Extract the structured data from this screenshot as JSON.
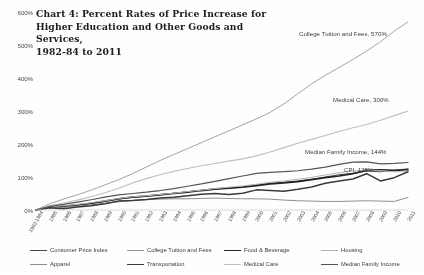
{
  "chart_data": {
    "type": "line",
    "title": "Chart 4: Percent Rates of Price Increase for\nHigher Education and Other Goods and Services,\n1982-84 to 2011",
    "xlabel": "",
    "ylabel": "",
    "ylim": [
      0,
      600
    ],
    "yticks": [
      0,
      100,
      200,
      300,
      400,
      500,
      600
    ],
    "ytick_labels": [
      "0%",
      "100%",
      "200%",
      "300%",
      "400%",
      "500%",
      "600%"
    ],
    "grid": false,
    "legend_position": "bottom",
    "x": [
      "1982-1984",
      "1985",
      "1986",
      "1987",
      "1988",
      "1989",
      "1990",
      "1991",
      "1992",
      "1993",
      "1994",
      "1995",
      "1996",
      "1997",
      "1998",
      "1999",
      "2000",
      "2001",
      "2002",
      "2003",
      "2004",
      "2005",
      "2006",
      "2007",
      "2008",
      "2009",
      "2010",
      "2011"
    ],
    "series": [
      {
        "name": "Consumer Price Index",
        "color": "#4a4a4a",
        "width": 1.0,
        "final_value": 125,
        "values": [
          0,
          9,
          11,
          15,
          20,
          26,
          33,
          38,
          42,
          47,
          51,
          55,
          60,
          64,
          66,
          70,
          76,
          81,
          84,
          88,
          93,
          100,
          107,
          111,
          118,
          116,
          120,
          125
        ]
      },
      {
        "name": "College Tuition and Fees",
        "color": "#9a9a9a",
        "width": 0.9,
        "final_value": 570,
        "values": [
          0,
          19,
          33,
          46,
          60,
          76,
          92,
          110,
          130,
          150,
          168,
          186,
          204,
          222,
          240,
          258,
          276,
          296,
          322,
          352,
          382,
          408,
          432,
          456,
          482,
          510,
          542,
          570
        ]
      },
      {
        "name": "Food & Beverage",
        "color": "#232323",
        "width": 1.7,
        "final_value": 122,
        "values": [
          0,
          9,
          11,
          15,
          20,
          27,
          34,
          39,
          42,
          46,
          50,
          54,
          59,
          63,
          66,
          69,
          74,
          79,
          82,
          86,
          92,
          98,
          103,
          110,
          121,
          122,
          120,
          122
        ]
      },
      {
        "name": "Housing",
        "color": "#b5b5b5",
        "width": 1.0,
        "final_value": 118,
        "values": [
          0,
          9,
          13,
          17,
          22,
          28,
          35,
          40,
          43,
          47,
          51,
          56,
          60,
          65,
          69,
          73,
          78,
          84,
          88,
          93,
          99,
          106,
          113,
          118,
          122,
          119,
          116,
          118
        ]
      },
      {
        "name": "Apparel",
        "color": "#8f8f8f",
        "width": 1.0,
        "final_value": 38,
        "values": [
          0,
          6,
          8,
          12,
          16,
          20,
          25,
          29,
          31,
          33,
          34,
          34,
          35,
          36,
          35,
          34,
          34,
          33,
          30,
          28,
          27,
          26,
          26,
          27,
          28,
          27,
          26,
          38
        ]
      },
      {
        "name": "Transportation",
        "color": "#3a3a3a",
        "width": 1.5,
        "final_value": 116,
        "values": [
          0,
          7,
          4,
          9,
          13,
          19,
          27,
          29,
          32,
          36,
          39,
          43,
          48,
          50,
          47,
          51,
          61,
          59,
          57,
          63,
          70,
          81,
          88,
          94,
          110,
          88,
          98,
          116
        ]
      },
      {
        "name": "Medical Care",
        "color": "#c0c0c0",
        "width": 1.1,
        "final_value": 300,
        "values": [
          0,
          13,
          21,
          30,
          40,
          52,
          66,
          82,
          95,
          107,
          117,
          126,
          134,
          141,
          148,
          155,
          164,
          176,
          189,
          202,
          214,
          226,
          238,
          249,
          259,
          272,
          286,
          300
        ]
      },
      {
        "name": "Median Family Income",
        "color": "#555555",
        "width": 1.2,
        "final_value": 144,
        "values": [
          0,
          11,
          17,
          24,
          31,
          39,
          46,
          50,
          54,
          59,
          65,
          72,
          79,
          87,
          95,
          103,
          111,
          114,
          116,
          119,
          124,
          130,
          138,
          145,
          146,
          140,
          141,
          144
        ]
      }
    ],
    "annotations": [
      {
        "text": "College Tuition and Fees, 570%",
        "x": 299,
        "y": 30
      },
      {
        "text": "Medical Care, 300%",
        "x": 333,
        "y": 96
      },
      {
        "text": "Median Family Income, 144%",
        "x": 305,
        "y": 148
      },
      {
        "text": "CPI, 125%",
        "x": 344,
        "y": 166
      }
    ],
    "legend": [
      {
        "label": "Consumer Price Index",
        "color": "#4a4a4a",
        "width": 1.2
      },
      {
        "label": "College Tuition and Fees",
        "color": "#9a9a9a",
        "width": 1.2
      },
      {
        "label": "Food & Beverage",
        "color": "#232323",
        "width": 1.9
      },
      {
        "label": "Housing",
        "color": "#b5b5b5",
        "width": 1.2
      },
      {
        "label": "Apparel",
        "color": "#8f8f8f",
        "width": 1.2
      },
      {
        "label": "Transportation",
        "color": "#3a3a3a",
        "width": 1.7
      },
      {
        "label": "Medical Care",
        "color": "#c0c0c0",
        "width": 1.3
      },
      {
        "label": "Median Family Income",
        "color": "#555555",
        "width": 1.5
      }
    ]
  }
}
